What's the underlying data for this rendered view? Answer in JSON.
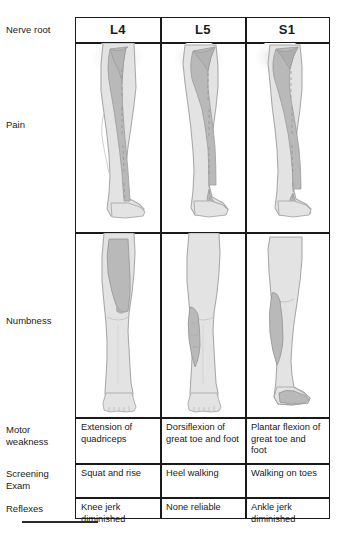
{
  "figure": {
    "row_label_header": "Nerve root",
    "columns": [
      "L4",
      "L5",
      "S1"
    ],
    "rows": [
      {
        "label": "Pain",
        "type": "illustration"
      },
      {
        "label": "Numbness",
        "type": "illustration"
      },
      {
        "label": "Motor\nweakness",
        "type": "text"
      },
      {
        "label": "Screening\nExam",
        "type": "text"
      },
      {
        "label": "Reflexes",
        "type": "text"
      }
    ]
  },
  "labels": {
    "nerve_root": "Nerve root",
    "pain": "Pain",
    "numbness": "Numbness",
    "motor_weakness_line1": "Motor",
    "motor_weakness_line2": "weakness",
    "screening_exam_line1": "Screening",
    "screening_exam_line2": "Exam",
    "reflexes": "Reflexes"
  },
  "header": {
    "l4": "L4",
    "l5": "L5",
    "s1": "S1"
  },
  "motor_weakness": {
    "l4": "Extension of quadriceps",
    "l5": "Dorsiflexion of great toe and foot",
    "s1": "Plantar flexion of great toe and foot"
  },
  "screening_exam": {
    "l4": "Squat and rise",
    "l5": "Heel walking",
    "s1": "Walking on toes"
  },
  "reflexes": {
    "l4": "Knee jerk diminished",
    "l5": "None reliable",
    "s1": "Ankle jerk diminished"
  },
  "illustrations": {
    "pain": {
      "l4": "leg-lateral-view-with-anterior-medial-dermatome-band",
      "l5": "leg-lateral-view-with-lateral-dermatome-band-to-foot",
      "s1": "leg-lateral-view-with-posterior-dermatome-band-to-foot"
    },
    "numbness": {
      "l4": "leg-anterior-view-with-medial-knee-patch",
      "l5": "leg-anterior-view-with-lateral-lower-leg-patch",
      "s1": "leg-lateral-view-with-posterior-calf-and-lateral-foot-patch"
    }
  },
  "colors": {
    "border": "#1a1a1a",
    "text": "#1a1a1a",
    "limb_fill": "#e3e3e3",
    "limb_outline": "#a9a9a9",
    "dermatome_fill": "#b9b9b9",
    "dermatome_outline": "#9a9a9a",
    "halo": "#ededed",
    "background": "#ffffff"
  }
}
